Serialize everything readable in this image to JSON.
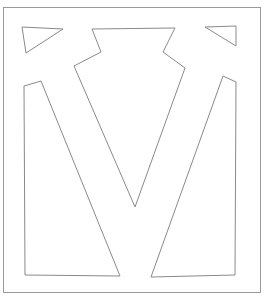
{
  "figure": {
    "width": 268,
    "height": 301,
    "background": "#ffffff",
    "stroke_color": "#8a8a8a",
    "frame_color": "#9a9a9a",
    "stroke_width": 1
  },
  "shapes": {
    "frame": {
      "x": 3.5,
      "y": 7.5,
      "width": 257,
      "height": 285
    },
    "top_left_triangle": {
      "points": "22,27 63,29 26,53"
    },
    "top_right_triangle": {
      "points": "205,27 236,26 236,46"
    },
    "center_v": {
      "points": "92,29 175,28 163,52 185,68 135,207 74,66 101,52"
    },
    "left_quad": {
      "points": "24,86 41,81 120,276 25,275"
    },
    "right_quad": {
      "points": "223,76 236,82 235,275 151,277"
    }
  }
}
